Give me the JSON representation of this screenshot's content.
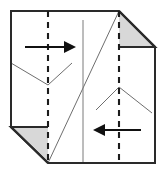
{
  "figure": {
    "canvas": {
      "width": 165,
      "height": 172
    },
    "background_color": "#ffffff"
  },
  "colors": {
    "paper_face": "#ffffff",
    "outline": "#2a2a2a",
    "flap_shade": "#d8d8d8",
    "flap_edge": "#2a2a2a",
    "crease_thin": "#6e6e6e",
    "crease_center": "#7a7a7a",
    "fold_line_dashed": "#1c1c1c",
    "arrow": "#111111"
  },
  "sheet": {
    "name": "paper-sheet",
    "description": "Square sheet with two opposite corners folded back",
    "outline_points": "11,11 119,11 155,47 155,163 48,163 11,127",
    "corners": {
      "top_left": [
        11,
        11
      ],
      "top_right_cut": [
        119,
        11
      ],
      "right_upper": [
        155,
        47
      ],
      "bottom_right": [
        155,
        163
      ],
      "bottom_left_cut": [
        48,
        163
      ],
      "left_lower": [
        11,
        127
      ]
    }
  },
  "flaps": [
    {
      "name": "top-right-folded-flap",
      "fill": "#d8d8d8",
      "points": "119,11 155,47 119,47",
      "edge_path": "M 119 11 L 155 47 L 119 47",
      "position": "top-right"
    },
    {
      "name": "bottom-left-folded-flap",
      "fill": "#d8d8d8",
      "points": "48,163 11,127 48,127",
      "edge_path": "M 48 163 L 11 127 L 48 127",
      "position": "bottom-left"
    }
  ],
  "fold_lines": [
    {
      "name": "left-vertical-fold-line",
      "style": "dashed",
      "orientation": "vertical",
      "x": 48,
      "y1": 11,
      "y2": 163
    },
    {
      "name": "right-vertical-fold-line",
      "style": "dashed",
      "orientation": "vertical",
      "x": 119,
      "y1": 11,
      "y2": 163
    }
  ],
  "creases": [
    {
      "name": "center-vertical-crease",
      "style": "thin-solid",
      "path": "M 83 20 L 83 163"
    },
    {
      "name": "main-diagonal-crease",
      "style": "thin-solid",
      "path": "M 48 163 L 119 11"
    },
    {
      "name": "left-valley-crease",
      "style": "thin-solid",
      "path": "M 11 63 L 48 85 L 72 63"
    },
    {
      "name": "right-peak-crease",
      "style": "thin-solid",
      "path": "M 96 110 L 119 87 L 152 113"
    },
    {
      "name": "top-right-flap-edge-crease",
      "style": "thin-solid",
      "path": "M 119 11 L 119 47"
    }
  ],
  "arrows": [
    {
      "name": "top-fold-arrow-right",
      "direction": "right",
      "shaft": {
        "x1": 25,
        "y1": 47,
        "x2": 66,
        "y2": 47
      },
      "head_points": "76,47 64,41 64,53",
      "meaning": "fold left panel to the right"
    },
    {
      "name": "bottom-fold-arrow-left",
      "direction": "left",
      "shaft": {
        "x1": 141,
        "y1": 130,
        "x2": 103,
        "y2": 130
      },
      "head_points": "93,130 105,124 105,136",
      "meaning": "fold right panel to the left"
    }
  ]
}
